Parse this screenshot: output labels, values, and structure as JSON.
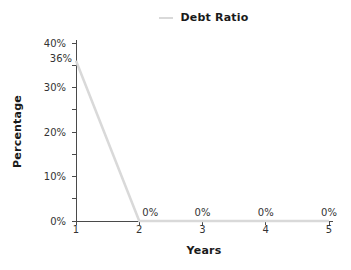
{
  "chart_data": {
    "type": "line",
    "title": "",
    "legend": {
      "position": "top-center",
      "entries": [
        {
          "label": "Debt Ratio",
          "color": "#d9d9d9"
        }
      ]
    },
    "xlabel": "Years",
    "ylabel": "Percentage",
    "x": [
      1,
      2,
      3,
      4,
      5
    ],
    "x_tick_labels": [
      "1",
      "2",
      "3",
      "4",
      "5"
    ],
    "y_tick_labels": [
      "0%",
      "10%",
      "20%",
      "30%",
      "40%"
    ],
    "ylim": [
      0,
      40
    ],
    "y_major_step": 10,
    "y_minor_step": 5,
    "grid": "off",
    "series": [
      {
        "name": "Debt Ratio",
        "color": "#d9d9d9",
        "values": [
          36,
          0,
          0,
          0,
          0
        ],
        "point_labels": [
          "36%",
          "0%",
          "0%",
          "0%",
          "0%"
        ]
      }
    ],
    "colors": {
      "background": "#ffffff",
      "axis": "#4a4a4a",
      "tick_text": "#333333",
      "label_text": "#1a1a1a",
      "series_line": "#d9d9d9"
    }
  }
}
